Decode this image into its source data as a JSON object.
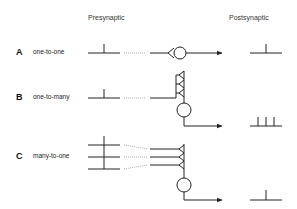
{
  "headers": {
    "presynaptic": "Presynaptic",
    "postsynaptic": "Postsynaptic"
  },
  "rows": [
    {
      "letter": "A",
      "label": "one-to-one"
    },
    {
      "letter": "B",
      "label": "one-to-many"
    },
    {
      "letter": "C",
      "label": "many-to-one"
    }
  ],
  "colors": {
    "stroke": "#222222",
    "dotted": "#888888",
    "background": "#ffffff"
  }
}
